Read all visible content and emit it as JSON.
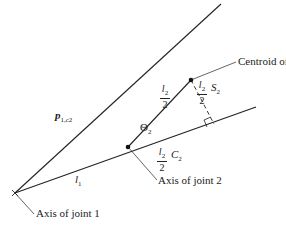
{
  "diagram": {
    "labels": {
      "centroid": "Centroid of link 2",
      "axis_joint1": "Axis of joint 1",
      "axis_joint2": "Axis of joint 2",
      "p_vector": "p",
      "p_sub": "1,c2",
      "l1": "l",
      "l1_sub": "1",
      "theta": "Θ",
      "theta_sub": "2",
      "frac_num": "l",
      "frac_num_sub": "2",
      "frac_den": "2",
      "s2": "S",
      "s2_sub": "2",
      "c2": "C",
      "c2_sub": "2"
    },
    "colors": {
      "line": "#222222",
      "background": "#ffffff"
    }
  }
}
